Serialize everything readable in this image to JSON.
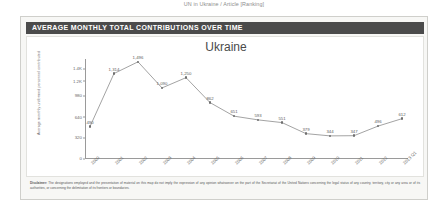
{
  "top_caption": "UN in Ukraine / Article [Ranking]",
  "card": {
    "header_title": "AVERAGE MONTHLY TOTAL CONTRIBUTIONS OVER TIME"
  },
  "footer": {
    "label": "Disclaimer:",
    "text": " The designations employed and the presentation of material on this map do not imply the expression of any opinion whatsoever on the part of the Secretariat of the United Nations concerning the legal status of any country, territory, city or any area or of its authorities, or concerning the delimitation of its frontiers or boundaries."
  },
  "chart_data": {
    "type": "line",
    "title": "Ukraine",
    "xlabel": "",
    "ylabel": "Average monthly uniformed personnel contributed",
    "ylim": [
      0,
      1540
    ],
    "yticks": [
      "0",
      "320",
      "640",
      "980",
      "1.2K",
      "1.4K"
    ],
    "ytick_values": [
      0,
      320,
      640,
      980,
      1200,
      1400
    ],
    "grid": false,
    "legend": "none",
    "categories": [
      "2000",
      "2001",
      "2002",
      "2003",
      "2004",
      "2005",
      "2006",
      "2007",
      "2008",
      "2009",
      "2010",
      "2011",
      "2012",
      "2013 Q1"
    ],
    "values": [
      490,
      1314,
      1496,
      1090,
      1250,
      862,
      651,
      593,
      551,
      379,
      344,
      347,
      496,
      612
    ],
    "value_labels": [
      "490",
      "1,314",
      "1,496",
      "1,090",
      "1,250",
      "862",
      "651",
      "593",
      "551",
      "379",
      "344",
      "347",
      "496",
      "612"
    ],
    "line_color": "#8c8c8c",
    "marker_color": "#6f6f6f"
  }
}
